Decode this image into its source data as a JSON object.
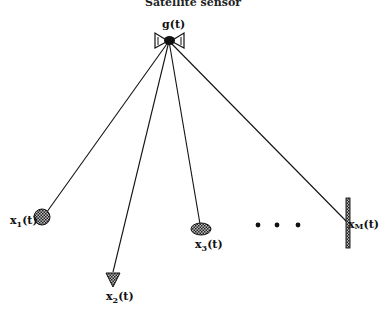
{
  "title": "Satellite sensor",
  "hub": {
    "label_base": "g",
    "label_arg": "(t)",
    "icon": "satellite-sensor-icon"
  },
  "nodes": [
    {
      "id": "x1",
      "base": "x",
      "sub": "1",
      "arg": "(t)",
      "shape": "circle",
      "icon": "circle-shaded-icon"
    },
    {
      "id": "x2",
      "base": "x",
      "sub": "2",
      "arg": "(t)",
      "shape": "triangle",
      "icon": "triangle-shaded-icon"
    },
    {
      "id": "x3",
      "base": "x",
      "sub": "3",
      "arg": "(t)",
      "shape": "ellipse",
      "icon": "ellipse-shaded-icon"
    },
    {
      "id": "xM",
      "base": "x",
      "sub": "M",
      "arg": "(t)",
      "shape": "bar",
      "icon": "vertical-bar-icon"
    }
  ],
  "ellipsis": "• • •"
}
